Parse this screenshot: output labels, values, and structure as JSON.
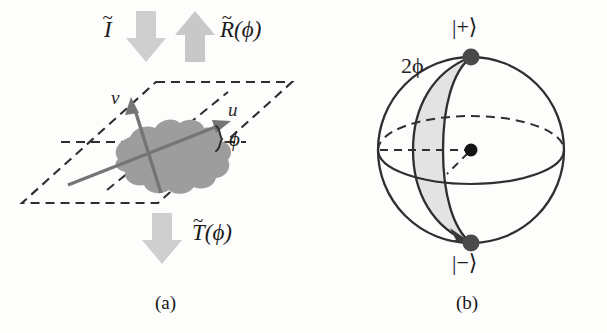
{
  "figure": {
    "width": 607,
    "height": 333,
    "background": "#fdfdfc",
    "panels": [
      {
        "id": "a",
        "caption": "(a)",
        "description": "plane with blob and rotated u-v axes"
      },
      {
        "id": "b",
        "caption": "(b)",
        "description": "Bloch sphere with plus and minus poles"
      }
    ]
  },
  "panel_a": {
    "caption": "(a)",
    "operators": {
      "identity": {
        "base": "I",
        "accent": "~",
        "label": "Ĩ"
      },
      "rotation": {
        "base": "R",
        "accent": "~",
        "arg": "(ϕ)",
        "label": "R̃(ϕ)"
      },
      "transform": {
        "base": "T",
        "accent": "~",
        "arg": "(ϕ)",
        "label": "T̃(ϕ)"
      }
    },
    "arrows": [
      {
        "name": "identity-arrow",
        "direction": "down",
        "color": "#cdcdcd"
      },
      {
        "name": "rotation-arrow",
        "direction": "up",
        "color": "#c9c9c9"
      },
      {
        "name": "transform-arrow",
        "direction": "down",
        "color": "#cfcfcf"
      }
    ],
    "axes": [
      {
        "name": "u",
        "label": "u",
        "color": "#767676"
      },
      {
        "name": "v",
        "label": "v",
        "color": "#767676"
      }
    ],
    "angle": {
      "label": "ϕ",
      "between": "u-axis and horizontal reference"
    },
    "blob": {
      "name": "state-blob",
      "color": "#9d9d9d"
    },
    "plane": {
      "name": "plane-parallelogram",
      "style": "dashed",
      "color": "#2e2e2e"
    }
  },
  "panel_b": {
    "caption": "(b)",
    "sphere": {
      "name": "bloch-sphere",
      "outline_color": "#303030",
      "lune_fill": "#e2e2e2"
    },
    "poles": [
      {
        "name": "plus-state",
        "label": "|+⟩",
        "position": "top"
      },
      {
        "name": "minus-state",
        "label": "|−⟩",
        "position": "bottom"
      }
    ],
    "angle_label": "2ϕ",
    "center_dot": {
      "name": "sphere-center-dot",
      "color": "#151515"
    },
    "rotation_arrow": {
      "name": "rotation-direction-arrow",
      "points_to": "minus-state"
    }
  },
  "colors": {
    "ink": "#1b1b1b",
    "arrow_gray": "#cdcdcd",
    "blob_gray": "#9d9d9d",
    "axis_gray": "#767676",
    "lune_gray": "#e2e2e2",
    "sphere_line": "#303030"
  }
}
